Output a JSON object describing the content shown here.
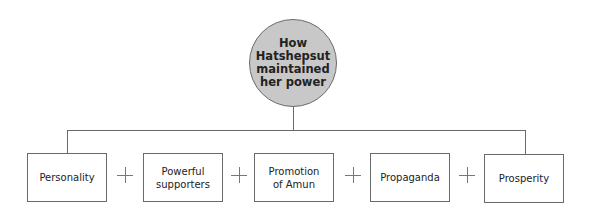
{
  "diagram": {
    "center": {
      "label": "How\nHatshepsut\nmaintained\nher power",
      "fill": "#c8c8c8"
    },
    "factors": [
      {
        "label": "Personality"
      },
      {
        "label": "Powerful\nsupporters"
      },
      {
        "label": "Promotion\nof Amun"
      },
      {
        "label": "Propaganda"
      },
      {
        "label": "Prosperity"
      }
    ],
    "connector_symbol": "+",
    "line_color": "#6a6a6a"
  }
}
